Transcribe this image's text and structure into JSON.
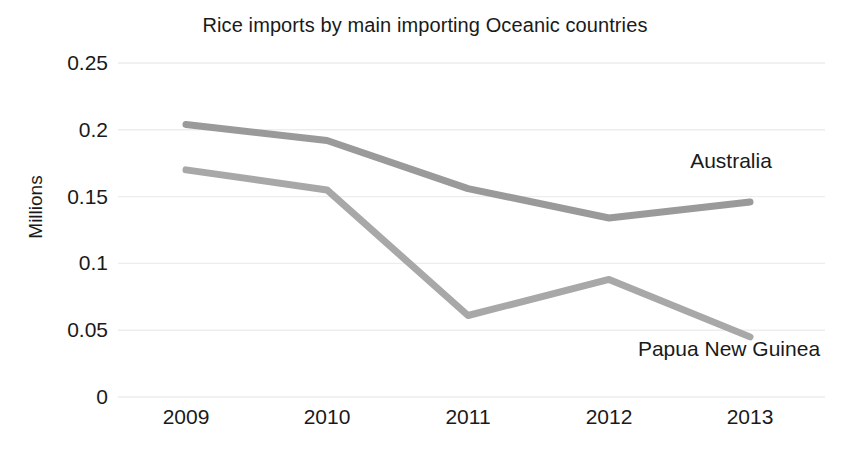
{
  "chart_data": {
    "type": "line",
    "title": "Rice imports by main importing Oceanic countries",
    "xlabel": "",
    "ylabel": "Millions",
    "categories": [
      "2009",
      "2010",
      "2011",
      "2012",
      "2013"
    ],
    "x_tick_labels": [
      "2009",
      "2010",
      "2011",
      "2012",
      "2013"
    ],
    "y_tick_labels": [
      "0.25",
      "0.2",
      "0.15",
      "0.1",
      "0.05",
      "0"
    ],
    "y_tick_values": [
      0.25,
      0.2,
      0.15,
      0.1,
      0.05,
      0
    ],
    "ylim": [
      0,
      0.25
    ],
    "grid": true,
    "grid_axis": "y",
    "grid_color": "#ededed",
    "legend_position": "inline-right",
    "series": [
      {
        "name": "Australia",
        "label": "Australia",
        "color": "#9a9a9a",
        "values": [
          0.204,
          0.192,
          0.156,
          0.134,
          0.146
        ]
      },
      {
        "name": "Papua New Guinea",
        "label": "Papua New Guinea",
        "color": "#a8a8a8",
        "values": [
          0.17,
          0.155,
          0.061,
          0.088,
          0.045
        ]
      }
    ]
  },
  "style": {
    "background": "#ffffff",
    "text_color": "#1a1a1a"
  }
}
